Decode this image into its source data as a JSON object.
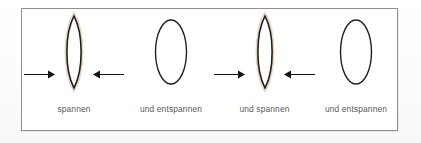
{
  "figure": {
    "title": "Spannen und Entspannen",
    "language": "de",
    "frame": {
      "border_color": "#8e9094",
      "background_color": "#ffffff"
    },
    "colors": {
      "outline": "#231f1c",
      "glow": "#dcc5ae",
      "glow_soft": "#efe2d4",
      "caption_text": "#58595b",
      "arrow": "#141414",
      "page_background": "#fdfdfd"
    },
    "stages": [
      {
        "id": "stage-1",
        "caption": "spannen",
        "state": "tensed",
        "shape": "lens",
        "glow": true,
        "arrows": [
          "arrow-right-pointing-in",
          "arrow-left-pointing-in"
        ]
      },
      {
        "id": "stage-2",
        "caption": "und entspannen",
        "state": "relaxed",
        "shape": "ellipse",
        "glow": false,
        "arrows": []
      },
      {
        "id": "stage-3",
        "caption": "und spannen",
        "state": "tensed",
        "shape": "lens",
        "glow": true,
        "arrows": [
          "arrow-right-pointing-in",
          "arrow-left-pointing-in"
        ]
      },
      {
        "id": "stage-4",
        "caption": "und entspannen",
        "state": "relaxed",
        "shape": "ellipse",
        "glow": false,
        "arrows": []
      }
    ]
  }
}
